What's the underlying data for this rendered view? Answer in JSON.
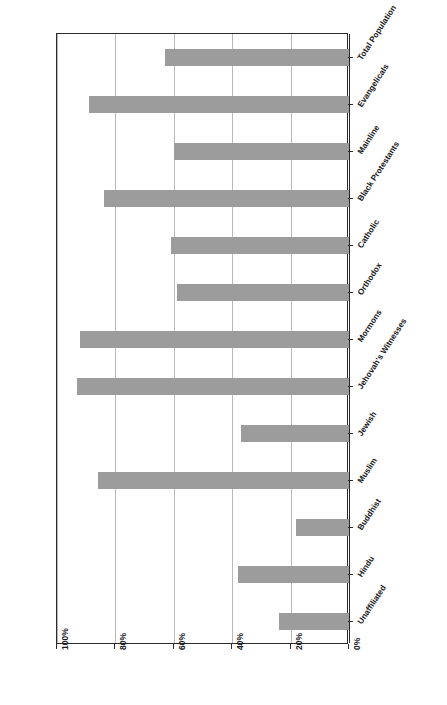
{
  "figure": {
    "title": "Figure 5.2: Is the Bible/Your Holy Scripture the Word of God?",
    "source": "Source: Pew U.S. Religious Landscape Survey, 2008"
  },
  "axis": {
    "value_ticks": [
      "100%",
      "80%",
      "60%",
      "40%",
      "20%",
      "0%"
    ],
    "value_tick_numbers": [
      100,
      80,
      60,
      40,
      20,
      0
    ]
  },
  "style": {
    "bar_color": "#9c9c9c",
    "grid_color": "#b9b9b9",
    "axis_color": "#2b2b2b",
    "background": "#ffffff"
  },
  "chart_data": {
    "type": "bar",
    "orientation": "horizontal-rotated",
    "title": "Figure 5.2: Is the Bible/Your Holy Scripture the Word of God?",
    "xlabel": "",
    "ylabel": "",
    "ylim": [
      0,
      100
    ],
    "grid": true,
    "legend": "none",
    "source": "Source: Pew U.S. Religious Landscape Survey, 2008",
    "categories": [
      "Total Population",
      "Evangelicals",
      "Mainline",
      "Black Protestants",
      "Catholic",
      "Orthodox",
      "Mormons",
      "Jehovah's Witnesses",
      "Jewish",
      "Muslim",
      "Buddhist",
      "Hindu",
      "Unaffiliated"
    ],
    "values": [
      63,
      89,
      60,
      84,
      61,
      59,
      92,
      93,
      37,
      86,
      18,
      38,
      24
    ],
    "tick_labels": [
      "0%",
      "20%",
      "40%",
      "60%",
      "80%",
      "100%"
    ]
  }
}
